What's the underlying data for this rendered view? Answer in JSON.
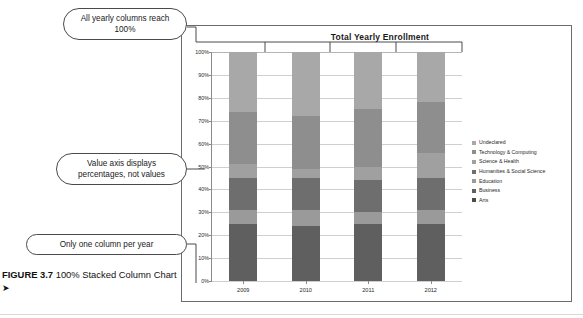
{
  "figure": {
    "caption_label": "FIGURE 3.7",
    "caption_text": "100% Stacked Column Chart",
    "caption_arrow": "➤"
  },
  "callouts": [
    {
      "id": "callout-0",
      "text": "All yearly columns reach 100%"
    },
    {
      "id": "callout-1",
      "text": "Value axis displays percentages, not values"
    },
    {
      "id": "callout-2",
      "text": "Only one column per year"
    }
  ],
  "chart_data": {
    "type": "bar",
    "subtype": "100% stacked column",
    "title": "Total Yearly Enrollment",
    "xlabel": "",
    "ylabel": "",
    "ylim": [
      0,
      100
    ],
    "ytick_labels": [
      "0%",
      "10%",
      "20%",
      "30%",
      "40%",
      "50%",
      "60%",
      "70%",
      "80%",
      "90%",
      "100%"
    ],
    "ytick_values": [
      0,
      10,
      20,
      30,
      40,
      50,
      60,
      70,
      80,
      90,
      100
    ],
    "grid": true,
    "legend_position": "right",
    "categories": [
      "2009",
      "2010",
      "2011",
      "2012"
    ],
    "series": [
      {
        "name": "Undeclared",
        "color": "#a8a8a8",
        "values": [
          26,
          28,
          25,
          22
        ]
      },
      {
        "name": "Technology & Computing",
        "color": "#8e8e8e",
        "values": [
          23,
          23,
          25,
          22
        ]
      },
      {
        "name": "Science & Health",
        "color": "#a0a0a0",
        "values": [
          6,
          4,
          6,
          11
        ]
      },
      {
        "name": "Humanities & Social Science",
        "color": "#6e6e6e",
        "values": [
          14,
          14,
          14,
          14
        ]
      },
      {
        "name": "Education",
        "color": "#9a9a9a",
        "values": [
          6,
          7,
          5,
          6
        ]
      },
      {
        "name": "Business",
        "color": "#5f5f5f",
        "values": [
          25,
          24,
          25,
          25
        ]
      },
      {
        "name": "Arts",
        "color": "#4a4a4a",
        "values": [
          0,
          0,
          0,
          0
        ]
      }
    ]
  }
}
